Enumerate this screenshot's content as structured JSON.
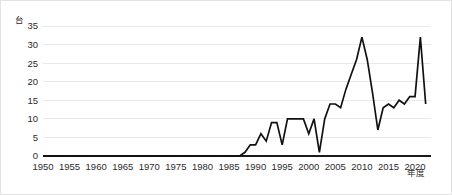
{
  "chart_data": {
    "type": "line",
    "title": "",
    "subtitle": "",
    "xlabel": "年度",
    "ylabel": "",
    "yunit": "台",
    "xlim": [
      1950,
      2023
    ],
    "ylim": [
      0,
      35
    ],
    "grid": true,
    "legend": false,
    "legend_position": "none",
    "yticks": [
      0,
      5,
      10,
      15,
      20,
      25,
      30,
      35
    ],
    "ytick_labels": [
      "0",
      "5",
      "10",
      "15",
      "20",
      "25",
      "30",
      "35"
    ],
    "xticks": [
      1950,
      1955,
      1960,
      1965,
      1970,
      1975,
      1980,
      1985,
      1990,
      1995,
      2000,
      2005,
      2010,
      2015,
      2020
    ],
    "xtick_labels": [
      "1950",
      "1955",
      "1960",
      "1965",
      "1970",
      "1975",
      "1980",
      "1985",
      "1990",
      "1995",
      "2000",
      "2005",
      "2010",
      "2015",
      "2020"
    ],
    "series": [
      {
        "name": "台数",
        "color": "#111111",
        "x": [
          1950,
          1951,
          1952,
          1953,
          1954,
          1955,
          1956,
          1957,
          1958,
          1959,
          1960,
          1961,
          1962,
          1963,
          1964,
          1965,
          1966,
          1967,
          1968,
          1969,
          1970,
          1971,
          1972,
          1973,
          1974,
          1975,
          1976,
          1977,
          1978,
          1979,
          1980,
          1981,
          1982,
          1983,
          1984,
          1985,
          1986,
          1987,
          1988,
          1989,
          1990,
          1991,
          1992,
          1993,
          1994,
          1995,
          1996,
          1997,
          1998,
          1999,
          2000,
          2001,
          2002,
          2003,
          2004,
          2005,
          2006,
          2007,
          2008,
          2009,
          2010,
          2011,
          2012,
          2013,
          2014,
          2015,
          2016,
          2017,
          2018,
          2019,
          2020,
          2021,
          2022
        ],
        "values": [
          0,
          0,
          0,
          0,
          0,
          0,
          0,
          0,
          0,
          0,
          0,
          0,
          0,
          0,
          0,
          0,
          0,
          0,
          0,
          0,
          0,
          0,
          0,
          0,
          0,
          0,
          0,
          0,
          0,
          0,
          0,
          0,
          0,
          0,
          0,
          0,
          0,
          0,
          1,
          3,
          3,
          6,
          4,
          9,
          9,
          3,
          10,
          10,
          10,
          10,
          6,
          10,
          1,
          10,
          14,
          14,
          13,
          18,
          22,
          26,
          32,
          26,
          17,
          7,
          13,
          14,
          13,
          15,
          14,
          16,
          16,
          32,
          14
        ]
      }
    ]
  },
  "axes": {
    "y_unit_label": "台",
    "x_axis_label": "年度"
  }
}
